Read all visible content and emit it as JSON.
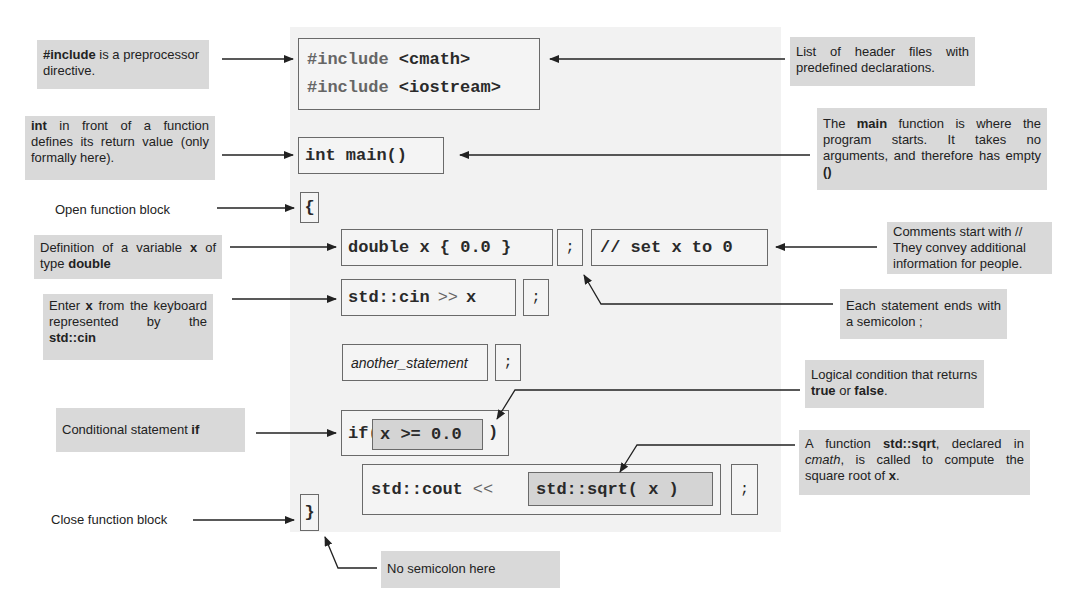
{
  "code_panel": {
    "background": "#f2f2f2",
    "include_line_1": {
      "keyword": "#include",
      "header": "<cmath>"
    },
    "include_line_2": {
      "keyword": "#include",
      "header": "<iostream>"
    },
    "main_signature": "int main()",
    "open_brace": "{",
    "var_definition": "double x { 0.0 }",
    "semicolon": ";",
    "comment": "// set x to 0",
    "cin_stream": "std::cin",
    "cin_operator": ">>",
    "cin_target": "x",
    "another_statement": "another_statement",
    "if_keyword": "if(",
    "if_condition": "x >= 0.0",
    "if_close": ")",
    "cout_stream": "std::cout",
    "cout_operator": "<<",
    "sqrt_call": "std::sqrt( x )",
    "close_brace": "}"
  },
  "annotations_left": {
    "include": {
      "bold": "#include",
      "rest": " is a preprocessor directive."
    },
    "int_return": {
      "bold": "int",
      "rest": " in front of a function defines its return value (only formally here)."
    },
    "open_block": "Open function block",
    "definition": {
      "pre": "Definition of a variable ",
      "bold1": "x",
      "mid": " of type ",
      "bold2": "double"
    },
    "enter_x": {
      "pre": "Enter ",
      "bold1": "x",
      "mid": " from the keyboard represented by the ",
      "bold2": "std::cin"
    },
    "conditional": {
      "pre": "Conditional statement ",
      "bold": "if"
    },
    "close_block": "Close function block"
  },
  "annotations_right": {
    "header_list": "List of header files with predefined declarations.",
    "main_function": {
      "pre": "The ",
      "bold": "main",
      "mid": " function is where the program starts. It takes no arguments, and therefore has empty ",
      "bold2": "()"
    },
    "comments": {
      "line1": "Comments start with //",
      "rest": "They convey additional information for people."
    },
    "statement_end": "Each statement ends with a semicolon ;",
    "logical": {
      "pre": "Logical condition that returns ",
      "bold1": "true",
      "mid": " or ",
      "bold2": "false",
      "post": "."
    },
    "sqrt": {
      "pre": "A function ",
      "bold1": "std::sqrt",
      "mid1": ", declared in ",
      "italic": "cmath",
      "mid2": ", is called to compute the square root of ",
      "bold2": "x",
      "post": "."
    },
    "no_semicolon": "No semicolon here"
  },
  "colors": {
    "note_background": "#d9d9d9",
    "code_box_border": "#6a6a6a",
    "inner_box_fill": "#d4d4d4",
    "arrow": "#222222"
  }
}
